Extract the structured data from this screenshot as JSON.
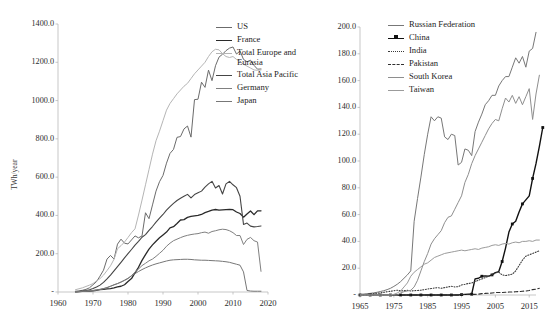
{
  "chart_data": [
    {
      "id": "left",
      "type": "line",
      "title": "",
      "xlabel": "",
      "ylabel": "TWh/year",
      "xlim": [
        1960,
        2020
      ],
      "ylim": [
        0,
        1400
      ],
      "xticks": [
        "1960",
        "1970",
        "1980",
        "1990",
        "2000",
        "2010",
        "2020"
      ],
      "yticks": [
        "-",
        "200.0",
        "400.0",
        "600.0",
        "800.0",
        "1000.0",
        "1200.0",
        "1400.0"
      ],
      "grid": false,
      "legend_position": "top-right",
      "x_start": 1965,
      "series": [
        {
          "name": "US",
          "color": "#6b6b6b",
          "width": 1.0,
          "dash": "none",
          "values": [
            4,
            6,
            9,
            14,
            22,
            38,
            54,
            83,
            114,
            172,
            191,
            172,
            250,
            276,
            255,
            251,
            272,
            293,
            283,
            293,
            414,
            383,
            455,
            527,
            576,
            609,
            673,
            724,
            745,
            808,
            812,
            852,
            867,
            809,
            1005,
            1007,
            1096,
            1069,
            1159,
            1104,
            1182,
            1227,
            1242,
            1261,
            1274,
            1280,
            1243,
            1259,
            1215,
            1203,
            1211,
            1184,
            1164,
            1165
          ]
        },
        {
          "name": "France",
          "color": "#2a2a2a",
          "width": 1.3,
          "dash": "none",
          "values": [
            1,
            2,
            3,
            4,
            5,
            6,
            9,
            12,
            14,
            16,
            18,
            22,
            27,
            30,
            38,
            55,
            70,
            100,
            129,
            165,
            195,
            224,
            246,
            265,
            283,
            298,
            313,
            335,
            341,
            358,
            376,
            378,
            390,
            395,
            398,
            400,
            405,
            415,
            421,
            428,
            431,
            428,
            429,
            430,
            431,
            430,
            418,
            410,
            391,
            408,
            423,
            404,
            424,
            424
          ]
        },
        {
          "name": "Total Europe and\nEurasia",
          "color": "#b5b5b5",
          "width": 1.0,
          "dash": "none",
          "values": [
            12,
            17,
            22,
            29,
            36,
            44,
            58,
            70,
            88,
            112,
            137,
            171,
            226,
            242,
            261,
            285,
            310,
            330,
            402,
            480,
            560,
            640,
            720,
            790,
            840,
            895,
            950,
            985,
            1010,
            1035,
            1055,
            1075,
            1090,
            1115,
            1140,
            1160,
            1180,
            1200,
            1230,
            1255,
            1268,
            1265,
            1245,
            1230,
            1225,
            1230,
            1215,
            1205,
            1190,
            1180,
            1170,
            1160,
            1158,
            1160
          ]
        },
        {
          "name": "Total Asia Pacific",
          "color": "#454545",
          "width": 1.1,
          "dash": "none",
          "values": [
            1,
            3,
            5,
            8,
            12,
            18,
            26,
            36,
            50,
            68,
            88,
            110,
            133,
            155,
            178,
            200,
            222,
            245,
            265,
            286,
            300,
            322,
            342,
            365,
            386,
            405,
            428,
            446,
            463,
            478,
            490,
            500,
            510,
            492,
            509,
            518,
            527,
            548,
            565,
            578,
            543,
            556,
            512,
            565,
            578,
            560,
            545,
            500,
            353,
            360,
            344,
            340,
            342,
            345
          ]
        },
        {
          "name": "Germany",
          "color": "#808080",
          "width": 1.0,
          "dash": "none",
          "values": [
            1,
            2,
            3,
            4,
            6,
            8,
            10,
            13,
            17,
            23,
            30,
            38,
            44,
            52,
            60,
            70,
            86,
            104,
            120,
            138,
            150,
            163,
            172,
            186,
            202,
            218,
            239,
            255,
            268,
            276,
            284,
            291,
            296,
            300,
            303,
            305,
            310,
            313,
            307,
            316,
            320,
            325,
            328,
            326,
            320,
            310,
            295,
            295,
            248,
            275,
            285,
            268,
            261,
            108
          ]
        },
        {
          "name": "Japan",
          "color": "#777777",
          "width": 1.0,
          "dash": "none",
          "values": [
            1,
            2,
            3,
            4,
            6,
            8,
            11,
            14,
            18,
            23,
            30,
            37,
            44,
            52,
            62,
            72,
            84,
            96,
            107,
            117,
            126,
            134,
            141,
            147,
            152,
            157,
            162,
            166,
            168,
            169,
            170,
            171,
            171,
            170,
            168,
            167,
            166,
            166,
            165,
            164,
            163,
            162,
            160,
            158,
            155,
            150,
            145,
            140,
            105,
            8,
            5,
            4,
            4,
            4
          ]
        }
      ]
    },
    {
      "id": "right",
      "type": "line",
      "title": "",
      "xlabel": "",
      "ylabel": "",
      "xlim": [
        1965,
        2017
      ],
      "ylim": [
        0,
        200
      ],
      "xticks": [
        "1965",
        "1975",
        "1985",
        "1995",
        "2005",
        "2015"
      ],
      "yticks": [
        "-",
        "20.0",
        "40.0",
        "60.0",
        "80.0",
        "100.0",
        "120.0",
        "140.0",
        "160.0",
        "180.0",
        "200.0"
      ],
      "grid": false,
      "legend_position": "top-right",
      "x_start": 1965,
      "series": [
        {
          "name": "Russian Federation",
          "color": "#777777",
          "width": 1.0,
          "dash": "none",
          "marker": "none",
          "values": [
            0.5,
            0.7,
            0.9,
            1.2,
            1.6,
            2.0,
            2.6,
            3.2,
            4.0,
            5.0,
            6.4,
            8.0,
            10.0,
            12.5,
            15.0,
            18.0,
            55.0,
            72.0,
            88.0,
            105.0,
            120.0,
            133.0,
            130.0,
            133.0,
            132.0,
            118.0,
            116.0,
            120.0,
            119.0,
            97.0,
            99.0,
            109.0,
            108.0,
            104.0,
            122.0,
            129.0,
            135.0,
            142.0,
            145.0,
            149.0,
            149.0,
            156.0,
            160.0,
            163.0,
            163.0,
            170.0,
            177.0,
            173.0,
            178.0,
            170.0,
            182.0,
            184.0,
            196.0
          ]
        },
        {
          "name": "China",
          "color": "#111111",
          "width": 1.4,
          "dash": "none",
          "marker": "square",
          "values": [
            0,
            0,
            0,
            0,
            0,
            0,
            0,
            0,
            0,
            0,
            0,
            0,
            0,
            0,
            0,
            0,
            0,
            0,
            0,
            0,
            0,
            0,
            0,
            0,
            0,
            0,
            0,
            0,
            0,
            0,
            0.3,
            0.5,
            0.6,
            0.6,
            12.0,
            12.5,
            14.0,
            14.3,
            14.1,
            15.0,
            16.7,
            17.5,
            25.0,
            35.0,
            47.0,
            53.0,
            55.0,
            62.0,
            68.0,
            71.0,
            74.0,
            87.0,
            98.0,
            111.0,
            125.0
          ]
        },
        {
          "name": "India",
          "color": "#3a3a3a",
          "width": 1.1,
          "dash": "dotted",
          "marker": "none",
          "values": [
            0.2,
            0.3,
            0.5,
            0.8,
            1.0,
            1.3,
            1.6,
            2.0,
            2.4,
            2.8,
            3.2,
            3.6,
            3.0,
            3.2,
            3.5,
            3.0,
            3.2,
            3.4,
            3.6,
            4.0,
            4.5,
            4.8,
            5.2,
            5.5,
            5.0,
            5.5,
            6.0,
            6.5,
            6.0,
            6.2,
            7.5,
            8.0,
            8.6,
            9.0,
            10.0,
            11.0,
            12.0,
            13.0,
            14.0,
            15.0,
            16.5,
            17.0,
            15.0,
            14.5,
            15.0,
            15.5,
            18.0,
            22.0,
            26.0,
            29.0,
            30.0,
            31.0,
            32.0,
            33.0
          ]
        },
        {
          "name": "Pakistan",
          "color": "#2f2f2f",
          "width": 1.1,
          "dash": "dashed",
          "marker": "none",
          "values": [
            0,
            0,
            0,
            0,
            0,
            0,
            0,
            0,
            0,
            0,
            0,
            0,
            0,
            0,
            0,
            0,
            0,
            0,
            0,
            0,
            0,
            0,
            0,
            0,
            0,
            0,
            0,
            0,
            0,
            0,
            0.3,
            0.4,
            0.4,
            0.5,
            0.5,
            0.6,
            1.0,
            1.2,
            1.3,
            1.5,
            1.8,
            1.9,
            1.8,
            2.0,
            2.2,
            2.3,
            2.4,
            2.6,
            2.8,
            3.0,
            3.4,
            4.0,
            4.4,
            5.0
          ]
        },
        {
          "name": "South Korea",
          "color": "#8e8e8e",
          "width": 1.0,
          "dash": "none",
          "marker": "none",
          "values": [
            0,
            0,
            0,
            0,
            0,
            0,
            0,
            0,
            0,
            0,
            0,
            0,
            1.5,
            2.5,
            3.0,
            3.5,
            6.0,
            11.0,
            18.0,
            25.0,
            31.0,
            38.0,
            42.0,
            45.0,
            48.0,
            54.0,
            58.0,
            59.0,
            64.0,
            69.0,
            74.0,
            84.0,
            90.0,
            98.0,
            104.0,
            109.0,
            114.0,
            119.0,
            124.0,
            128.0,
            131.0,
            130.0,
            139.0,
            147.0,
            144.0,
            149.0,
            143.0,
            148.0,
            142.0,
            148.0,
            154.0,
            131.0,
            150.0,
            164.0
          ]
        },
        {
          "name": "Taiwan",
          "color": "#9b9b9b",
          "width": 1.0,
          "dash": "none",
          "marker": "none",
          "values": [
            0,
            0,
            0,
            0,
            0,
            0,
            0,
            0,
            0,
            0,
            0.5,
            1.5,
            3.0,
            6.0,
            9.0,
            14.0,
            17.0,
            19.0,
            21.0,
            23.0,
            24.0,
            26.0,
            28.0,
            29.0,
            30.0,
            31.0,
            31.5,
            32.0,
            32.5,
            33.0,
            33.5,
            33.0,
            33.5,
            34.0,
            34.5,
            34.0,
            35.0,
            35.5,
            36.0,
            37.0,
            37.5,
            37.0,
            38.0,
            38.5,
            38.0,
            39.0,
            39.5,
            39.0,
            40.0,
            40.0,
            40.5,
            40.0,
            41.0,
            41.0
          ]
        }
      ]
    }
  ],
  "left_chart": {
    "legend": [
      {
        "label": "US"
      },
      {
        "label": "France"
      },
      {
        "label": "Total Europe and\nEurasia"
      },
      {
        "label": "Total Asia Pacific"
      },
      {
        "label": "Germany"
      },
      {
        "label": "Japan"
      }
    ]
  },
  "right_chart": {
    "legend": [
      {
        "label": "Russian Federation"
      },
      {
        "label": "China"
      },
      {
        "label": "India"
      },
      {
        "label": "Pakistan"
      },
      {
        "label": "South Korea"
      },
      {
        "label": "Taiwan"
      }
    ]
  }
}
